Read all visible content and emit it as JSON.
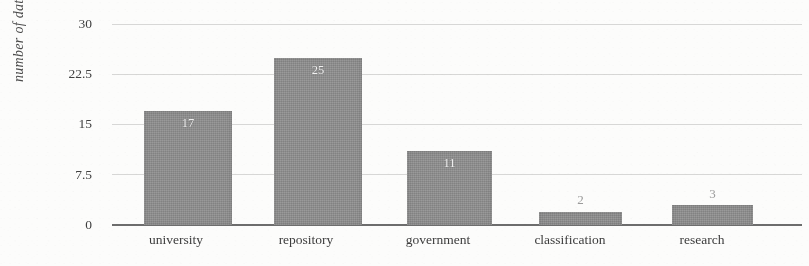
{
  "chart_data": {
    "type": "bar",
    "title": "",
    "subtitle": "",
    "xlabel": "",
    "ylabel": "number of datasets",
    "categories": [
      "university",
      "repository",
      "government",
      "classification",
      "research"
    ],
    "values": [
      17,
      25,
      11,
      2,
      3
    ],
    "value_labels": [
      "17",
      "25",
      "11",
      "2",
      "3"
    ],
    "ylim": [
      0,
      30
    ],
    "y_ticks": [
      0,
      7.5,
      15,
      22.5,
      30
    ],
    "y_tick_labels": [
      "0",
      "7.5",
      "15",
      "22.5",
      "30"
    ],
    "grid": true,
    "grid_axis": "y",
    "legend": false,
    "legend_position": "none",
    "series": [
      {
        "name": "number of datasets",
        "values": [
          17,
          25,
          11,
          2,
          3
        ]
      }
    ],
    "colors": {
      "bar_fill": "#8e8e8e",
      "gridline": "#d8d8d6",
      "axis_line": "#6b6b6b",
      "inside_label": "#f2f2f2",
      "outside_label": "#9a9a9a",
      "tick_text": "#3a3a3a",
      "background": "#fdfdfc"
    },
    "label_placement": [
      "inside",
      "inside",
      "inside",
      "above",
      "above"
    ]
  }
}
